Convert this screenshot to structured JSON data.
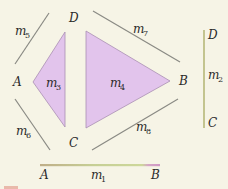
{
  "diagram": {
    "background": "#f6f4e6",
    "colors": {
      "region_fill": "#e2c4ec",
      "region_stroke": "#a98fb3",
      "line_gray": "#8a8a84",
      "m2_line": "#c3c48f",
      "m1_line_left": "#c2b08a",
      "m1_line_mid": "#c8d596",
      "m1_line_right": "#d8a0c8",
      "label_text": "#2a2a2a"
    },
    "vertices": {
      "A": "A",
      "B": "B",
      "C": "C",
      "D": "D"
    },
    "regions": [
      {
        "id": "m3",
        "name": "m",
        "sub": "3",
        "points": [
          [
            33,
            82
          ],
          [
            65,
            32
          ],
          [
            65,
            127
          ]
        ]
      },
      {
        "id": "m4",
        "name": "m",
        "sub": "4",
        "points": [
          [
            86,
            31
          ],
          [
            170,
            81
          ],
          [
            86,
            128
          ]
        ]
      }
    ],
    "edges": [
      {
        "id": "m5",
        "name": "m",
        "sub": "5",
        "from": [
          49,
          13
        ],
        "to": [
          15,
          64
        ]
      },
      {
        "id": "m6",
        "name": "m",
        "sub": "6",
        "from": [
          15,
          99
        ],
        "to": [
          50,
          150
        ]
      },
      {
        "id": "m7",
        "name": "m",
        "sub": "7",
        "from": [
          93,
          11
        ],
        "to": [
          180,
          62
        ]
      },
      {
        "id": "m8",
        "name": "m",
        "sub": "8",
        "from": [
          92,
          150
        ],
        "to": [
          178,
          99
        ]
      }
    ],
    "separate_edges": {
      "m2": {
        "name": "m",
        "sub": "2",
        "top_label": "D",
        "bottom_label": "C"
      },
      "m1": {
        "name": "m",
        "sub": "1",
        "left_label": "A",
        "right_label": "B"
      }
    },
    "labels": {
      "m5": {
        "name": "m",
        "sub": "5"
      },
      "m6": {
        "name": "m",
        "sub": "6"
      },
      "m7": {
        "name": "m",
        "sub": "7"
      },
      "m8": {
        "name": "m",
        "sub": "8"
      },
      "m3": {
        "name": "m",
        "sub": "3"
      },
      "m4": {
        "name": "m",
        "sub": "4"
      },
      "m2": {
        "name": "m",
        "sub": "2"
      },
      "m1": {
        "name": "m",
        "sub": "1"
      }
    }
  }
}
